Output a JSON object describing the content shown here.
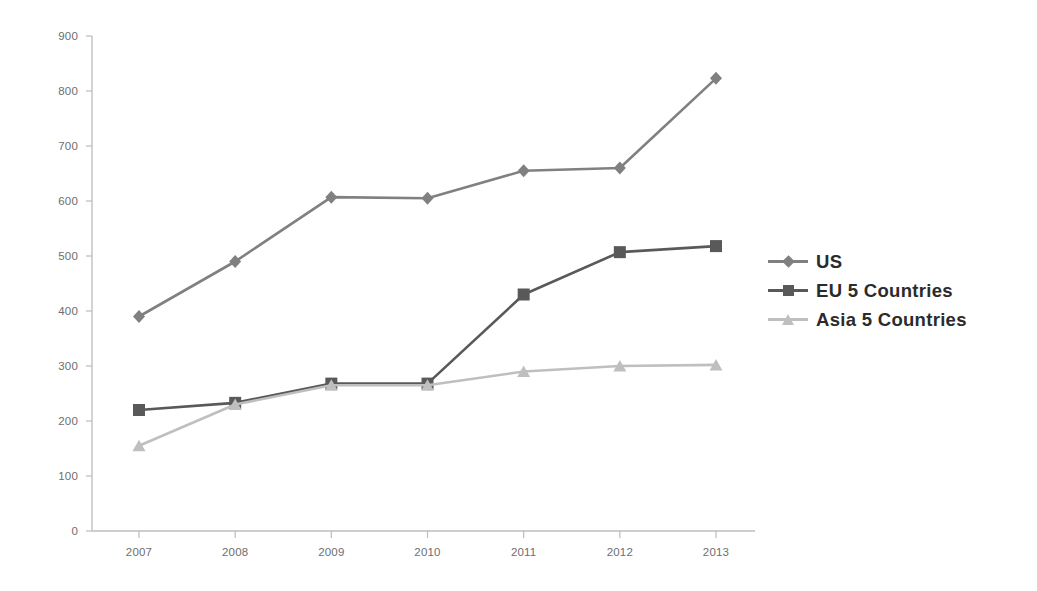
{
  "chart_data": {
    "type": "line",
    "title": "",
    "subtitle": "",
    "xlabel": "",
    "ylabel": "",
    "categories": [
      "2007",
      "2008",
      "2009",
      "2010",
      "2011",
      "2012",
      "2013"
    ],
    "x_tick_labels": [
      "2007",
      "2008",
      "2009",
      "2010",
      "2011",
      "2012",
      "2013"
    ],
    "y_tick_labels": [
      "0",
      "100",
      "200",
      "300",
      "400",
      "500",
      "600",
      "700",
      "800",
      "900"
    ],
    "y_ticks": [
      0,
      100,
      200,
      300,
      400,
      500,
      600,
      700,
      800,
      900
    ],
    "ylim": [
      0,
      900
    ],
    "grid": false,
    "legend_position": "right",
    "series": [
      {
        "name": "US",
        "color": "#808080",
        "marker": "diamond",
        "values": [
          390,
          490,
          607,
          605,
          655,
          660,
          823
        ]
      },
      {
        "name": "EU 5 Countries",
        "color": "#595959",
        "marker": "square",
        "values": [
          220,
          233,
          268,
          268,
          430,
          507,
          518
        ]
      },
      {
        "name": "Asia 5 Countries",
        "color": "#bfbfbf",
        "marker": "triangle",
        "values": [
          155,
          230,
          265,
          265,
          290,
          300,
          302
        ]
      }
    ]
  },
  "legend": {
    "items": [
      {
        "label": "US",
        "color": "#808080",
        "marker": "diamond"
      },
      {
        "label": "EU 5 Countries",
        "color": "#595959",
        "marker": "square"
      },
      {
        "label": "Asia 5 Countries",
        "color": "#bfbfbf",
        "marker": "triangle"
      }
    ]
  },
  "axes": {
    "axis_color": "#bcbcbc",
    "tick_label_color": "#6e6e6e"
  }
}
